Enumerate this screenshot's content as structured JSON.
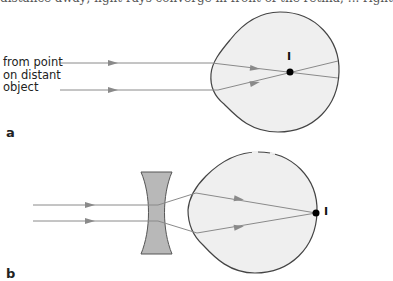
{
  "caption_fragment": "distance away; light rays converge in front of the retina; ... right",
  "panel_a": {
    "label": "a",
    "source_label_lines": [
      "from point",
      "on distant",
      "object"
    ],
    "focus_label": "I"
  },
  "panel_b": {
    "label": "b",
    "focus_label": "I"
  },
  "colors": {
    "eye_fill": "#efefef",
    "eye_outline": "#444444",
    "ray": "#8a8a8a",
    "lens_fill": "#b8b8b8",
    "focus_dot": "#000000"
  }
}
